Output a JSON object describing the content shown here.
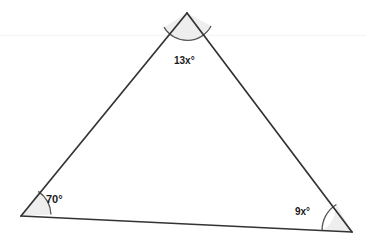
{
  "figure": {
    "kind": "triangle-angle-diagram",
    "background_color": "#ffffff",
    "stroke_color": "#333333",
    "arc_fill_color": "#eeeeee",
    "arc_stroke_color": "#555555",
    "faint_line_color": "#f7f7f7",
    "vertices": {
      "apex": {
        "x": 187,
        "y": 13
      },
      "bottom_left": {
        "x": 21,
        "y": 216
      },
      "bottom_right": {
        "x": 352,
        "y": 232
      }
    },
    "angles": [
      {
        "name": "apex-angle",
        "label": "13x°",
        "vertex": "apex",
        "arc_radius": 27
      },
      {
        "name": "bottom-left-angle",
        "label": "70°",
        "vertex": "bottom_left",
        "arc_radius": 30
      },
      {
        "name": "bottom-right-angle",
        "label": "9x°",
        "vertex": "bottom_right",
        "arc_radius": 30
      }
    ]
  }
}
